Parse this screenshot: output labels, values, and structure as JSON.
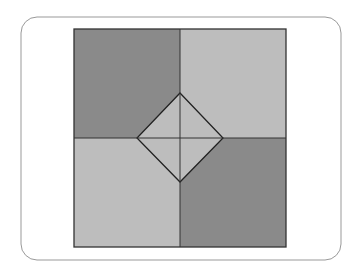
{
  "diagram": {
    "frame": {
      "x": 21,
      "y": 17,
      "width": 320,
      "height": 243,
      "radius": 16,
      "stroke": "#999999"
    },
    "square": {
      "x": 74,
      "y": 29,
      "width": 212,
      "height": 218,
      "stroke": "#333333"
    },
    "center": {
      "x": 180,
      "y": 138
    },
    "quadrants": {
      "top_left": "#8a8a8a",
      "top_right": "#bdbdbd",
      "bottom_left": "#bdbdbd",
      "bottom_right": "#8a8a8a"
    },
    "diamond": {
      "top": [
        180,
        93
      ],
      "right": [
        223,
        138
      ],
      "bottom": [
        180,
        182
      ],
      "left": [
        137,
        138
      ],
      "fill": "#bdbdbd",
      "stroke": "#222222"
    }
  }
}
